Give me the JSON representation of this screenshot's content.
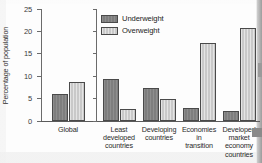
{
  "chart_data": {
    "type": "bar",
    "title": "",
    "xlabel": "",
    "ylabel": "Percentage of population",
    "ylim": [
      0,
      25
    ],
    "yticks": [
      "0",
      "5",
      "10",
      "15",
      "20",
      "25"
    ],
    "grid": false,
    "legend_position": "top-center",
    "categories": [
      "Global",
      "Least developed countries",
      "Developing countries",
      "Economies in transition",
      "Developed market economy countries"
    ],
    "category_lines": [
      [
        "Global"
      ],
      [
        "Least",
        "developed",
        "countries"
      ],
      [
        "Developing",
        "countries"
      ],
      [
        "Economies",
        "in",
        "transition"
      ],
      [
        "Developed",
        "market",
        "economy",
        "countries"
      ]
    ],
    "series": [
      {
        "name": "Underweight",
        "color": "#7e7e7e",
        "values": [
          6.0,
          9.4,
          7.4,
          3.0,
          2.3
        ]
      },
      {
        "name": "Overweight",
        "color": "#c9c9c9",
        "values": [
          8.7,
          2.6,
          5.0,
          17.5,
          20.7
        ]
      }
    ],
    "panels": [
      {
        "name": "global-panel",
        "categories": [
          "Global"
        ]
      },
      {
        "name": "regions-panel",
        "categories": [
          "Least developed countries",
          "Developing countries",
          "Economies in transition",
          "Developed market economy countries"
        ]
      }
    ]
  },
  "legend": {
    "items": [
      {
        "label": "Underweight",
        "swatch": "under"
      },
      {
        "label": "Overweight",
        "swatch": "over"
      }
    ]
  }
}
